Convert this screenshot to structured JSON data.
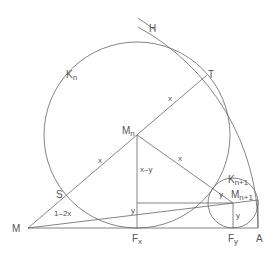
{
  "labels": {
    "H": "H",
    "T": "T",
    "Kn": "K",
    "Kn_sub": "n",
    "Mn": "M",
    "Mn_sub": "n",
    "S": "S",
    "M": "M",
    "Fx": "F",
    "Fx_sub": "x",
    "Fy": "F",
    "Fy_sub": "y",
    "A": "A",
    "Kn1": "K",
    "Kn1_sub": "n+1",
    "Mn1": "M",
    "Mn1_sub": "n+1",
    "x_MnT": "x",
    "x_SMn": "x",
    "x_MnKn1": "x",
    "x_minus_y": "x–y",
    "one_minus_2x": "1–2x",
    "y_left": "y",
    "y_right": "y",
    "y_tangent": "y"
  }
}
